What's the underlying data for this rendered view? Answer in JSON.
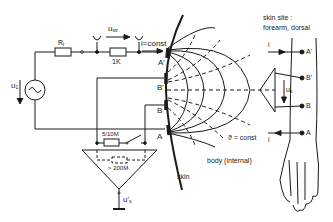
{
  "diagram": {
    "circuit": {
      "source_voltage": "u",
      "source_voltage_sub": "1",
      "internal_resistor": "R",
      "internal_resistor_sub": "i",
      "series_resistor": "1K",
      "stray_voltage": "u",
      "stray_voltage_sub": "str",
      "current_label": "i=const",
      "input_resistor": "5/10M",
      "amplifier_impedance": "> 200M",
      "output_voltage": "u'",
      "output_voltage_sub": "s"
    },
    "electrodes": {
      "a_prime": "A'",
      "b_prime": "B'",
      "b": "B",
      "a": "A"
    },
    "field": {
      "equipotential_label": "ϑ = const",
      "body_label": "body (internal)",
      "skin_label": "skin"
    },
    "arm": {
      "site_label_line1": "skin site :",
      "site_label_line2": "forearm, dorsal",
      "current_in": "i",
      "current_out": "i",
      "voltage": "u",
      "voltage_sub": "s",
      "a_prime": "A'",
      "b_prime": "B'",
      "b": "B",
      "a": "A"
    },
    "colors": {
      "ink": "#1a1a1a",
      "background": "#ffffff"
    }
  }
}
